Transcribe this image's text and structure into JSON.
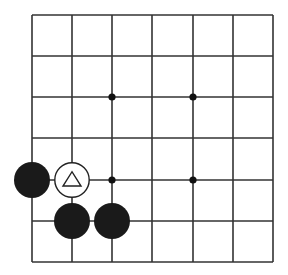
{
  "board": {
    "background": "#ffffff",
    "line_color": "#333333",
    "columns": 7,
    "rows": 7,
    "x_lines": [
      32,
      72,
      112,
      152,
      193,
      233,
      273
    ],
    "y_lines": [
      15,
      56,
      97,
      138,
      180,
      221,
      262
    ],
    "star_points": [
      {
        "col": 2,
        "row": 2
      },
      {
        "col": 4,
        "row": 2
      },
      {
        "col": 2,
        "row": 4
      },
      {
        "col": 4,
        "row": 4
      }
    ],
    "stones": [
      {
        "color": "black",
        "col": 0,
        "row": 4,
        "marker": ""
      },
      {
        "color": "white",
        "col": 1,
        "row": 4,
        "marker": "triangle"
      },
      {
        "color": "black",
        "col": 1,
        "row": 5,
        "marker": ""
      },
      {
        "color": "black",
        "col": 2,
        "row": 5,
        "marker": ""
      }
    ],
    "stone_colors": {
      "black": "#1a1a1a",
      "white": "#ffffff"
    }
  }
}
